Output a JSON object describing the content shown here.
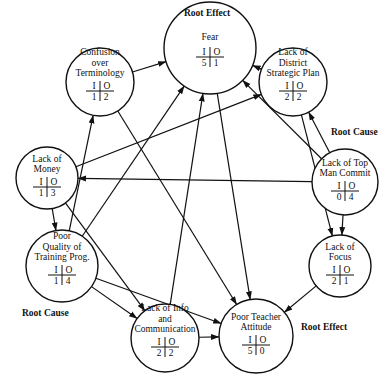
{
  "diagram": {
    "type": "interrelationship-digraph",
    "nodes": [
      {
        "id": "fear",
        "label_lines": [
          "Fear"
        ],
        "in": "5",
        "out": "1",
        "cx": 210,
        "cy": 48,
        "r": 46
      },
      {
        "id": "confusion",
        "label_lines": [
          "Confusion",
          "over",
          "Terminology"
        ],
        "in": "1",
        "out": "2",
        "cx": 100,
        "cy": 82,
        "r": 34
      },
      {
        "id": "strategic-plan",
        "label_lines": [
          "Lack of",
          "District",
          "Strategic Plan"
        ],
        "in": "2",
        "out": "2",
        "cx": 293,
        "cy": 82,
        "r": 34
      },
      {
        "id": "money",
        "label_lines": [
          "Lack of",
          "Money"
        ],
        "in": "1",
        "out": "3",
        "cx": 47,
        "cy": 178,
        "r": 31
      },
      {
        "id": "top-man",
        "label_lines": [
          "Lack of Top",
          "Man Commit"
        ],
        "in": "0",
        "out": "4",
        "cx": 345,
        "cy": 182,
        "r": 33
      },
      {
        "id": "training",
        "label_lines": [
          "Poor",
          "Quality of",
          "Training Prog."
        ],
        "in": "1",
        "out": "4",
        "cx": 62,
        "cy": 266,
        "r": 36
      },
      {
        "id": "focus",
        "label_lines": [
          "Lack of",
          "Focus"
        ],
        "in": "2",
        "out": "1",
        "cx": 340,
        "cy": 266,
        "r": 31
      },
      {
        "id": "info",
        "label_lines": [
          "Lack of Info",
          "and",
          "Communication"
        ],
        "in": "2",
        "out": "2",
        "cx": 165,
        "cy": 338,
        "r": 34
      },
      {
        "id": "teacher",
        "label_lines": [
          "Poor Teacher",
          "Attitude"
        ],
        "in": "5",
        "out": "0",
        "cx": 256,
        "cy": 336,
        "r": 37
      }
    ],
    "io_header": {
      "in": "I",
      "out": "O"
    },
    "annotations": [
      {
        "id": "root-effect-top",
        "text": "Root Effect",
        "x": 184,
        "y": 16
      },
      {
        "id": "root-cause-right",
        "text": "Root Cause",
        "x": 331,
        "y": 135
      },
      {
        "id": "root-cause-left",
        "text": "Root Cause",
        "x": 22,
        "y": 316
      },
      {
        "id": "root-effect-bottom",
        "text": "Root Effect",
        "x": 301,
        "y": 330
      }
    ],
    "edges": [
      {
        "from": "confusion",
        "to": "fear"
      },
      {
        "from": "confusion",
        "to": "teacher"
      },
      {
        "from": "strategic-plan",
        "to": "fear"
      },
      {
        "from": "strategic-plan",
        "to": "focus"
      },
      {
        "from": "money",
        "to": "strategic-plan"
      },
      {
        "from": "money",
        "to": "training"
      },
      {
        "from": "money",
        "to": "info"
      },
      {
        "from": "top-man",
        "to": "money"
      },
      {
        "from": "top-man",
        "to": "strategic-plan"
      },
      {
        "from": "top-man",
        "to": "fear"
      },
      {
        "from": "top-man",
        "to": "focus"
      },
      {
        "from": "training",
        "to": "confusion"
      },
      {
        "from": "training",
        "to": "fear"
      },
      {
        "from": "training",
        "to": "info"
      },
      {
        "from": "training",
        "to": "teacher"
      },
      {
        "from": "focus",
        "to": "teacher"
      },
      {
        "from": "info",
        "to": "fear"
      },
      {
        "from": "info",
        "to": "teacher"
      },
      {
        "from": "fear",
        "to": "teacher"
      }
    ]
  }
}
